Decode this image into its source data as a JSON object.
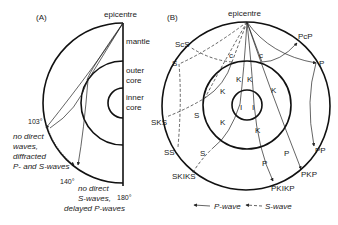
{
  "panel_a": {
    "label": "(A)",
    "epicentre": "epicentre",
    "layers": {
      "mantle": "mantle",
      "outer_core_1": "outer",
      "outer_core_2": "core",
      "inner_core_1": "inner",
      "inner_core_2": "core"
    },
    "angles": {
      "a103": "103°",
      "a140": "140°",
      "a180": "180°"
    },
    "shadow_zone_note": [
      "no direct",
      "waves,",
      "diffracted",
      "P- and S-waves"
    ],
    "far_zone_note": [
      "no direct",
      "S-waves,",
      "delayed P-waves"
    ]
  },
  "panel_b": {
    "label": "(B)",
    "epicentre": "epicentre",
    "phases": {
      "ScS": "ScS",
      "S": "S",
      "SKS": "SKS",
      "SS": "SS",
      "SKIKS": "SKIKS",
      "PcP": "PcP",
      "P": "P",
      "PP": "PP",
      "PKP": "PKP",
      "PKIKP": "PKIKP"
    },
    "segment_labels": {
      "c": "c",
      "K": "K",
      "I": "I",
      "S": "S",
      "P": "P"
    }
  },
  "legend": {
    "p_wave": "P-wave",
    "s_wave": "S-wave"
  }
}
